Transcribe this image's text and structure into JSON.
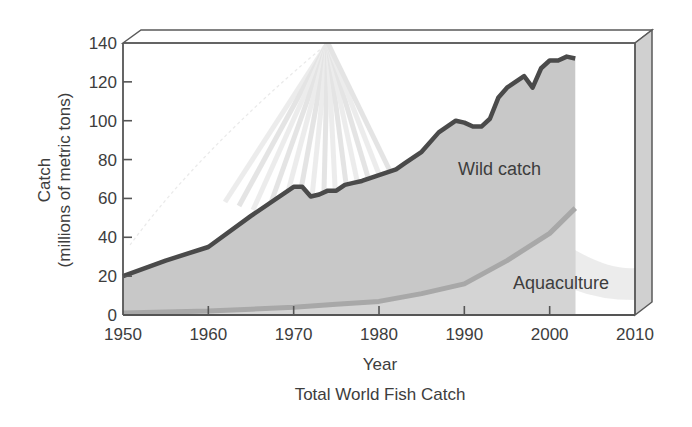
{
  "chart_data": {
    "type": "area",
    "title": "Total World Fish Catch",
    "xlabel": "Year",
    "ylabel": "Catch",
    "ylabel_sub": "(millions of metric tons)",
    "xlim": [
      1950,
      2010
    ],
    "ylim": [
      0,
      140
    ],
    "x_ticks": [
      1950,
      1960,
      1970,
      1980,
      1990,
      2000,
      2010
    ],
    "y_ticks": [
      0,
      20,
      40,
      60,
      80,
      100,
      120,
      140
    ],
    "grid": false,
    "legend": "inline labels",
    "series": [
      {
        "name": "Wild catch",
        "label": "Wild catch",
        "color": "#4a4a4a",
        "fill": "#c8c8c8",
        "x": [
          1950,
          1955,
          1960,
          1965,
          1970,
          1971,
          1972,
          1973,
          1974,
          1975,
          1976,
          1977,
          1978,
          1980,
          1982,
          1983,
          1985,
          1987,
          1989,
          1990,
          1991,
          1992,
          1993,
          1994,
          1995,
          1996,
          1997,
          1998,
          1999,
          2000,
          2001,
          2002,
          2003
        ],
        "values": [
          20,
          28,
          35,
          51,
          66,
          66,
          61,
          62,
          64,
          64,
          67,
          68,
          69,
          72,
          75,
          78,
          84,
          94,
          100,
          99,
          97,
          97,
          101,
          112,
          117,
          120,
          123,
          117,
          127,
          131,
          131,
          133,
          132
        ]
      },
      {
        "name": "Aquaculture",
        "label": "Aquaculture",
        "color": "#a8a8a8",
        "x": [
          1950,
          1955,
          1960,
          1965,
          1970,
          1975,
          1980,
          1985,
          1990,
          1995,
          2000,
          2003
        ],
        "values": [
          1,
          1.5,
          2,
          3,
          4,
          5.5,
          7,
          11,
          16,
          28,
          42,
          55
        ]
      }
    ]
  },
  "labels": {
    "ylabel": "Catch",
    "ylabel_sub": "(millions of metric tons)",
    "xlabel": "Year",
    "title": "Total World Fish Catch",
    "wild": "Wild catch",
    "aqua": "Aquaculture"
  }
}
